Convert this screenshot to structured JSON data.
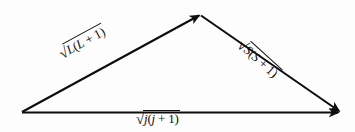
{
  "figure": {
    "background_color": "#fdfdfd",
    "stroke_color": "#0d0d0d",
    "width": 355,
    "height": 132
  },
  "geometry": {
    "origin_vertex": {
      "x": 22,
      "y": 112
    },
    "apex_vertex": {
      "x": 200,
      "y": 14
    },
    "right_vertex": {
      "x": 340,
      "y": 112
    }
  },
  "vectors": [
    {
      "id": "orbital",
      "name": "vector-L",
      "from": "origin_vertex",
      "to": "apex_vertex",
      "arrowhead": "end",
      "label": {
        "radical": "√",
        "radicand": "L(L + 1)",
        "parts": {
          "symbol": "L",
          "expression": "(L + 1)"
        },
        "rotation_deg": -28.5
      }
    },
    {
      "id": "spin",
      "name": "vector-S",
      "from": "apex_vertex",
      "to": "right_vertex",
      "arrowhead": "end",
      "label": {
        "radical": "√",
        "radicand": "S(S + 1)",
        "parts": {
          "symbol": "S",
          "expression": "(S + 1)"
        },
        "rotation_deg": 42
      }
    },
    {
      "id": "total",
      "name": "vector-j",
      "from": "origin_vertex",
      "to": "right_vertex",
      "arrowhead": "end",
      "label": {
        "radical": "√",
        "radicand": "j(j + 1)",
        "parts": {
          "symbol": "j",
          "expression": "(j + 1)"
        },
        "rotation_deg": 0
      }
    }
  ],
  "labels": {
    "left": {
      "radical": "√",
      "symbol": "L",
      "open": "(",
      "inner": "L",
      "op": " + ",
      "one": "1",
      "close": ")"
    },
    "right": {
      "radical": "√",
      "symbol": "S",
      "open": "(",
      "inner": "S",
      "op": " + ",
      "one": "1",
      "close": ")"
    },
    "bottom": {
      "radical": "√",
      "symbol": "j",
      "open": "(",
      "inner": "j",
      "op": " + ",
      "one": "1",
      "close": ")"
    }
  }
}
